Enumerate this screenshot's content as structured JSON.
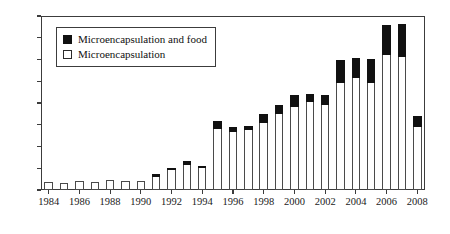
{
  "chart_data": {
    "type": "bar",
    "title": "",
    "subtitle": "",
    "xlabel": "",
    "ylabel": "",
    "stacked": true,
    "grid": false,
    "legend_position": "top-left",
    "ylim": [
      0,
      400
    ],
    "ytick_values": [
      400,
      350,
      300,
      250,
      200,
      150,
      100,
      50,
      0
    ],
    "ytick_labels": [
      "400",
      "350",
      "300",
      "250",
      "200",
      "150",
      "100",
      "50",
      "0"
    ],
    "xtick_labels": [
      "1984",
      "1986",
      "1988",
      "1990",
      "1992",
      "1994",
      "1996",
      "1998",
      "2000",
      "2002",
      "2004",
      "2006",
      "2008"
    ],
    "categories": [
      "1984",
      "1985",
      "1986",
      "1987",
      "1988",
      "1989",
      "1990",
      "1991",
      "1992",
      "1993",
      "1994",
      "1995",
      "1996",
      "1997",
      "1998",
      "1999",
      "2000",
      "2001",
      "2002",
      "2003",
      "2004",
      "2005",
      "2006",
      "2007",
      "2008"
    ],
    "series": [
      {
        "name": "Microencapsulation",
        "color": "#ffffff",
        "edge_color": "#4a4a4a",
        "values": [
          18,
          15,
          20,
          19,
          23,
          20,
          20,
          30,
          46,
          57,
          51,
          140,
          133,
          139,
          155,
          175,
          190,
          203,
          196,
          245,
          258,
          246,
          310,
          305,
          146
        ]
      },
      {
        "name": "Microencapsulation and food",
        "color": "#111111",
        "edge_color": "#111111",
        "values": [
          0,
          0,
          0,
          0,
          0,
          0,
          0,
          6,
          5,
          10,
          4,
          18,
          13,
          9,
          20,
          20,
          28,
          17,
          23,
          55,
          46,
          56,
          70,
          76,
          24
        ]
      }
    ]
  },
  "legend": {
    "items": [
      {
        "label": "Microencapsulation and food",
        "swatch": "filled-square-icon"
      },
      {
        "label": "Microencapsulation",
        "swatch": "open-square-icon"
      }
    ]
  }
}
